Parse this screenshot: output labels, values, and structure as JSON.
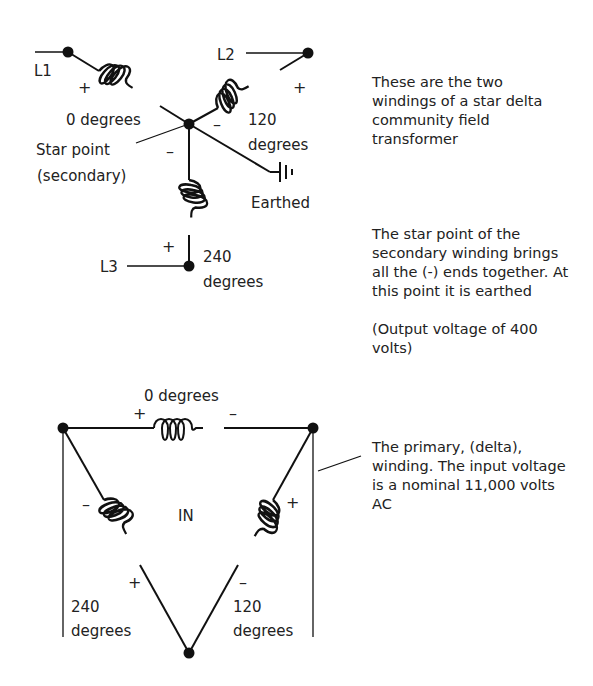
{
  "star": {
    "lines": [
      "L1",
      "L2",
      "L3"
    ],
    "phase0": "0 degrees",
    "phase120_a": "120",
    "phase120_b": "degrees",
    "phase240_a": "240",
    "phase240_b": "degrees",
    "star_point_a": "Star point",
    "star_point_b": "(secondary)",
    "earthed": "Earthed",
    "plus": "+",
    "minus": "–"
  },
  "delta": {
    "phase0": "0 degrees",
    "center_label": "IN",
    "phase240_a": "240",
    "phase240_b": "degrees",
    "phase120_a": "120",
    "phase120_b": "degrees",
    "plus": "+",
    "minus": "–"
  },
  "notes": {
    "note1": "These are the two windings of a star delta community field transformer",
    "note2": "The star point of the secondary winding brings all the (-) ends together. At this point it is earthed",
    "note2b": "(Output voltage of 400 volts)",
    "note3": "The primary, (delta), winding. The input voltage is a nominal 11,000 volts AC"
  }
}
